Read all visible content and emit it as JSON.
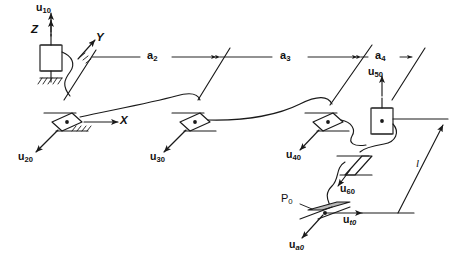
{
  "figure": {
    "kind": "kinematic-chain-schematic",
    "background_color": "#ffffff",
    "line_color": "#1a1a1a",
    "shade_color": "#b8b8b8"
  },
  "axes": {
    "x_label": "X",
    "y_label": "Y",
    "z_label": "Z"
  },
  "joint_variables": {
    "u10": {
      "base": "u",
      "sub": "10"
    },
    "u20": {
      "base": "u",
      "sub": "20"
    },
    "u30": {
      "base": "u",
      "sub": "30"
    },
    "u40": {
      "base": "u",
      "sub": "40"
    },
    "u50": {
      "base": "u",
      "sub": "50"
    },
    "u60": {
      "base": "u",
      "sub": "60"
    }
  },
  "tip_vectors": {
    "ut0": {
      "base": "u",
      "sub": "t0",
      "sub_italic": true
    },
    "ua0": {
      "base": "u",
      "sub": "a0",
      "sub_italic": true
    }
  },
  "point": {
    "p0": {
      "base": "P",
      "sub": "0"
    }
  },
  "dimensions": {
    "a2": {
      "base": "a",
      "sub": "2"
    },
    "a3": {
      "base": "a",
      "sub": "3"
    },
    "a4": {
      "base": "a",
      "sub": "4"
    },
    "l": {
      "base": "l"
    }
  }
}
